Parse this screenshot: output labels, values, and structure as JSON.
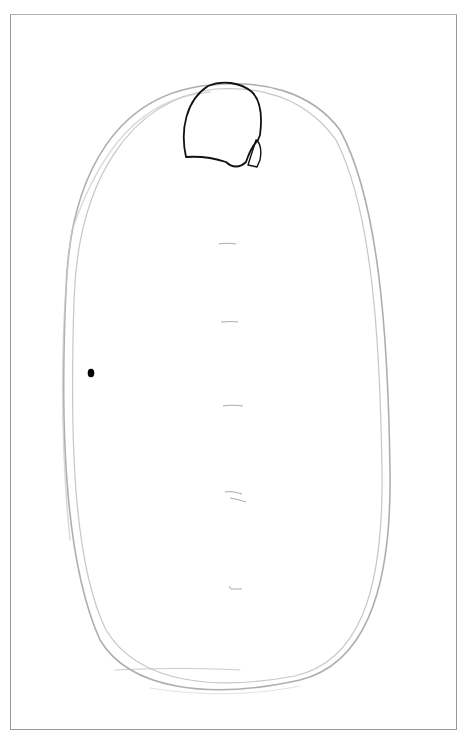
{
  "drawing": {
    "title": "Pencil sketch: oval table with head shape at top",
    "frame_color": "#9a9a9a",
    "outline_color": "#a8a8a8",
    "ink_color": "#111111",
    "marks": [
      {
        "y": 244,
        "label": ""
      },
      {
        "y": 322,
        "label": ""
      },
      {
        "y": 406,
        "label": ""
      },
      {
        "y": 492,
        "label": ""
      },
      {
        "y": 587,
        "label": ""
      }
    ],
    "dot": {
      "x": 91,
      "y": 373
    }
  }
}
